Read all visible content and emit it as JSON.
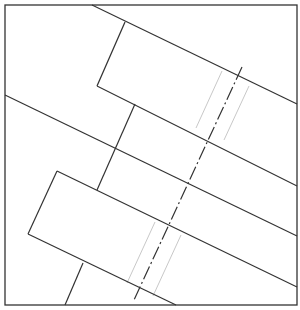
{
  "diagram": {
    "type": "technical-drawing",
    "colors": {
      "stroke": "#333333",
      "faint": "#c8c8c8",
      "background": "#ffffff"
    },
    "frame": {
      "x1": 5,
      "y1": 5,
      "x2": 297,
      "y2": 305
    },
    "lines": [
      {
        "id": "upper-strip-top-edge",
        "x1": 92,
        "y1": 5,
        "x2": 297,
        "y2": 104
      },
      {
        "id": "upper-strip-left-end",
        "x1": 125,
        "y1": 22,
        "x2": 97,
        "y2": 86
      },
      {
        "id": "upper-strip-bottom-edge",
        "x1": 97,
        "y1": 86,
        "x2": 297,
        "y2": 186
      },
      {
        "id": "long-diagonal",
        "x1": 5,
        "y1": 95,
        "x2": 297,
        "y2": 236
      },
      {
        "id": "middle-connector",
        "x1": 135,
        "y1": 104,
        "x2": 97,
        "y2": 190
      },
      {
        "id": "lower-strip-top-edge",
        "x1": 57,
        "y1": 171,
        "x2": 297,
        "y2": 287
      },
      {
        "id": "lower-strip-left-end",
        "x1": 57,
        "y1": 171,
        "x2": 28,
        "y2": 234
      },
      {
        "id": "lower-strip-bottom-edge",
        "x1": 28,
        "y1": 234,
        "x2": 176,
        "y2": 305
      },
      {
        "id": "bottom-connector",
        "x1": 83,
        "y1": 263,
        "x2": 65,
        "y2": 305
      }
    ],
    "centerline": {
      "x1": 242,
      "y1": 67,
      "x2": 134,
      "y2": 300,
      "dash": "14 3 2 3"
    },
    "faint_lines": [
      {
        "x1": 222,
        "y1": 71,
        "x2": 196,
        "y2": 128
      },
      {
        "x1": 249,
        "y1": 86,
        "x2": 224,
        "y2": 140
      },
      {
        "x1": 155,
        "y1": 222,
        "x2": 127,
        "y2": 283
      },
      {
        "x1": 181,
        "y1": 235,
        "x2": 153,
        "y2": 296
      }
    ]
  }
}
